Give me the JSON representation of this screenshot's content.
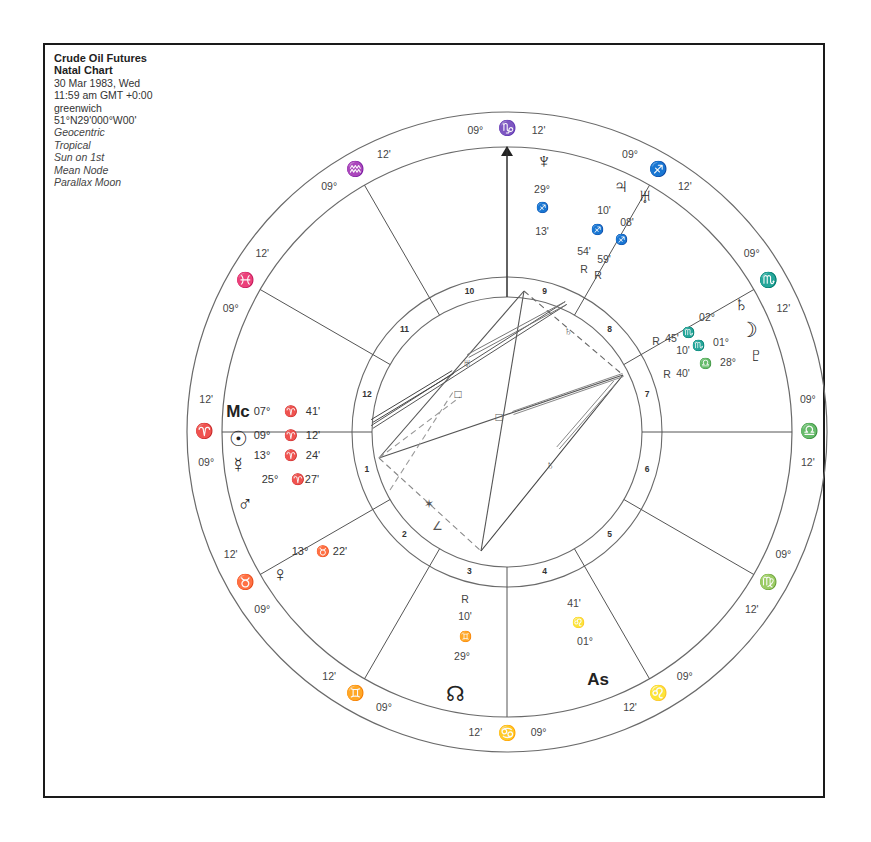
{
  "header": {
    "title": "Crude Oil Futures",
    "subtitle": "Natal Chart",
    "date": "30 Mar 1983, Wed",
    "time": "11:59 am  GMT +0:00",
    "place": "greenwich",
    "coords": "51°N29'000°W00'",
    "options": [
      "Geocentric",
      "Tropical",
      "Sun on 1st",
      "Mean Node",
      "Parallax Moon"
    ]
  },
  "wheel": {
    "center": [
      507,
      432
    ],
    "outer_radius": 320,
    "zodiac_inner_radius": 285,
    "house_band_outer_radius": 155,
    "aspect_circle_radius": 135,
    "line_color": "#6a6a6a"
  },
  "cusps": [
    {
      "angle": 90,
      "deg": "09°",
      "sign": "♑",
      "min": "12'",
      "note": "top"
    },
    {
      "angle": 120,
      "deg": "09°",
      "sign": "♒",
      "min": "12'"
    },
    {
      "angle": 150,
      "deg": "09°",
      "sign": "♓",
      "min": "12'"
    },
    {
      "angle": 180,
      "deg": "09°",
      "sign": "♈",
      "min": "12'"
    },
    {
      "angle": 210,
      "deg": "09°",
      "sign": "♉",
      "min": "12'"
    },
    {
      "angle": 240,
      "deg": "09°",
      "sign": "♊",
      "min": "12'"
    },
    {
      "angle": 270,
      "deg": "09°",
      "sign": "♋",
      "min": "12'"
    },
    {
      "angle": 300,
      "deg": "09°",
      "sign": "♌",
      "min": "12'"
    },
    {
      "angle": 330,
      "deg": "09°",
      "sign": "♍",
      "min": "12'"
    },
    {
      "angle": 0,
      "deg": "09°",
      "sign": "♎",
      "min": "12'"
    },
    {
      "angle": 30,
      "deg": "09°",
      "sign": "♏",
      "min": "12'"
    },
    {
      "angle": 60,
      "deg": "09°",
      "sign": "♐",
      "min": "12'"
    }
  ],
  "house_numbers": [
    {
      "n": "10",
      "angle": 105
    },
    {
      "n": "11",
      "angle": 135
    },
    {
      "n": "12",
      "angle": 165
    },
    {
      "n": "1",
      "angle": 195
    },
    {
      "n": "2",
      "angle": 225
    },
    {
      "n": "3",
      "angle": 255
    },
    {
      "n": "4",
      "angle": 285
    },
    {
      "n": "5",
      "angle": 315
    },
    {
      "n": "6",
      "angle": 345
    },
    {
      "n": "7",
      "angle": 15
    },
    {
      "n": "8",
      "angle": 45
    },
    {
      "n": "9",
      "angle": 75
    }
  ],
  "planets": [
    {
      "name": "Mc",
      "glyph": "Mc",
      "x": 238,
      "y": 413,
      "pos": [
        "07°",
        "♈",
        "41'"
      ],
      "px": [
        262,
        291,
        313
      ],
      "py": 412
    },
    {
      "name": "Sun",
      "glyph": "☉",
      "x": 238,
      "y": 440,
      "pos": [
        "09°",
        "♈",
        "12'"
      ],
      "px": [
        262,
        291,
        313
      ],
      "py": 436
    },
    {
      "name": "Mercury",
      "glyph": "☿",
      "x": 238,
      "y": 466,
      "pos": [
        "13°",
        "♈",
        "24'"
      ],
      "px": [
        262,
        291,
        313
      ],
      "py": 456
    },
    {
      "name": "Mars",
      "glyph": "♂",
      "x": 245,
      "y": 505,
      "pos": [
        "25°",
        "♈",
        "27'"
      ],
      "px": [
        270,
        298,
        312
      ],
      "py": 480
    },
    {
      "name": "Venus",
      "glyph": "♀",
      "x": 280,
      "y": 575,
      "pos": [
        "13°",
        "♉",
        "22'"
      ],
      "px": [
        300,
        323,
        340
      ],
      "py": 552
    },
    {
      "name": "Moon Node",
      "glyph": "☊",
      "x": 455,
      "y": 695,
      "pos": [
        "R̷",
        "10°",
        "♊",
        "29°"
      ]
    },
    {
      "name": "Asc",
      "glyph": "As",
      "x": 598,
      "y": 681
    },
    {
      "name": "Neptune",
      "glyph": "♆",
      "x": 544,
      "y": 162
    },
    {
      "name": "Jupiter",
      "glyph": "♃",
      "x": 621,
      "y": 187
    },
    {
      "name": "Uranus",
      "glyph": "♅",
      "x": 645,
      "y": 197
    },
    {
      "name": "Saturn",
      "glyph": "♄",
      "x": 741,
      "y": 305
    },
    {
      "name": "Moon",
      "glyph": "☽",
      "x": 748,
      "y": 331
    },
    {
      "name": "Pluto",
      "glyph": "♇",
      "x": 756,
      "y": 356
    }
  ],
  "inner_labels": [
    {
      "text": "29°",
      "x": 542,
      "y": 190
    },
    {
      "text": "♐",
      "x": 542,
      "y": 208
    },
    {
      "text": "13'",
      "x": 542,
      "y": 232
    },
    {
      "text": "10'",
      "x": 604,
      "y": 211
    },
    {
      "text": "♐",
      "x": 597,
      "y": 230
    },
    {
      "text": "08'",
      "x": 627,
      "y": 223
    },
    {
      "text": "♐",
      "x": 621,
      "y": 240
    },
    {
      "text": "54'",
      "x": 584,
      "y": 252
    },
    {
      "text": "59'",
      "x": 604,
      "y": 260
    },
    {
      "text": "R",
      "x": 584,
      "y": 270
    },
    {
      "text": "R",
      "x": 598,
      "y": 276
    },
    {
      "text": "R",
      "x": 656,
      "y": 342
    },
    {
      "text": "45'",
      "x": 672,
      "y": 339
    },
    {
      "text": "♏",
      "x": 688,
      "y": 333
    },
    {
      "text": "02°",
      "x": 707,
      "y": 318
    },
    {
      "text": "10'",
      "x": 683,
      "y": 351
    },
    {
      "text": "♏",
      "x": 698,
      "y": 346
    },
    {
      "text": "01°",
      "x": 721,
      "y": 343
    },
    {
      "text": "R",
      "x": 667,
      "y": 375
    },
    {
      "text": "40'",
      "x": 683,
      "y": 374
    },
    {
      "text": "♎",
      "x": 705,
      "y": 364
    },
    {
      "text": "28°",
      "x": 728,
      "y": 363
    },
    {
      "text": "R",
      "x": 465,
      "y": 600
    },
    {
      "text": "10'",
      "x": 465,
      "y": 617
    },
    {
      "text": "♊",
      "x": 465,
      "y": 637
    },
    {
      "text": "29°",
      "x": 462,
      "y": 657
    },
    {
      "text": "41'",
      "x": 574,
      "y": 604
    },
    {
      "text": "♌",
      "x": 578,
      "y": 623
    },
    {
      "text": "01°",
      "x": 585,
      "y": 642
    }
  ],
  "aspect_lines": [
    {
      "x1": 379,
      "y1": 458,
      "x2": 524,
      "y2": 291,
      "style": "solid",
      "color": "#555"
    },
    {
      "x1": 524,
      "y1": 291,
      "x2": 481,
      "y2": 551,
      "style": "solid",
      "color": "#555"
    },
    {
      "x1": 379,
      "y1": 458,
      "x2": 481,
      "y2": 551,
      "style": "dashed",
      "color": "#888"
    },
    {
      "x1": 524,
      "y1": 291,
      "x2": 623,
      "y2": 375,
      "style": "dashed",
      "color": "#666"
    },
    {
      "x1": 481,
      "y1": 551,
      "x2": 623,
      "y2": 375,
      "style": "solid",
      "color": "#444"
    },
    {
      "x1": 379,
      "y1": 458,
      "x2": 623,
      "y2": 375,
      "style": "solid",
      "color": "#555"
    },
    {
      "x1": 372,
      "y1": 427,
      "x2": 566,
      "y2": 303,
      "style": "double",
      "color": "#555"
    },
    {
      "x1": 372,
      "y1": 421,
      "x2": 453,
      "y2": 372,
      "style": "double",
      "color": "#444"
    },
    {
      "x1": 468,
      "y1": 356,
      "x2": 566,
      "y2": 303,
      "style": "double",
      "color": "#777"
    },
    {
      "x1": 379,
      "y1": 458,
      "x2": 460,
      "y2": 397,
      "style": "dashed",
      "color": "#999"
    },
    {
      "x1": 390,
      "y1": 490,
      "x2": 453,
      "y2": 392,
      "style": "dashed",
      "color": "#999"
    },
    {
      "x1": 513,
      "y1": 413,
      "x2": 623,
      "y2": 375,
      "style": "double",
      "color": "#888"
    },
    {
      "x1": 558,
      "y1": 448,
      "x2": 615,
      "y2": 382,
      "style": "double",
      "color": "#888"
    }
  ],
  "aspect_glyphs": [
    {
      "glyph": "✶",
      "x": 429,
      "y": 505
    },
    {
      "glyph": "∠",
      "x": 437,
      "y": 527
    },
    {
      "glyph": "□",
      "x": 458,
      "y": 395
    },
    {
      "glyph": "♅",
      "x": 467,
      "y": 364
    },
    {
      "glyph": "♄",
      "x": 568,
      "y": 332
    },
    {
      "glyph": "□",
      "x": 499,
      "y": 418
    },
    {
      "glyph": "♄",
      "x": 550,
      "y": 466
    }
  ]
}
